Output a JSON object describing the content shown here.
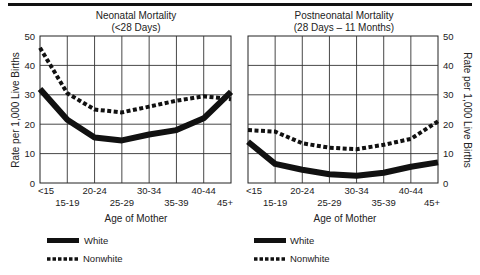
{
  "chart_data": [
    {
      "type": "line",
      "title": "Neonatal Mortality",
      "subtitle": "(<28 Days)",
      "xlabel": "Age of Mother",
      "ylabel": "Rate per 1,000 Live Births",
      "ylim": [
        0,
        50
      ],
      "yticks": [
        0,
        10,
        20,
        30,
        40,
        50
      ],
      "grid": true,
      "categories": [
        "<15",
        "15-19",
        "20-24",
        "25-29",
        "30-34",
        "35-39",
        "40-44",
        "45+"
      ],
      "series": [
        {
          "name": "White",
          "style": "solid-thick",
          "values": [
            32,
            21.5,
            15.5,
            14.5,
            16.5,
            18,
            22,
            31
          ]
        },
        {
          "name": "Nonwhite",
          "style": "dotted-thick",
          "values": [
            46,
            30.5,
            25,
            24,
            26,
            28,
            29.5,
            28.5
          ]
        }
      ],
      "legend": [
        "White",
        "Nonwhite"
      ],
      "legend_position": "bottom-left"
    },
    {
      "type": "line",
      "title": "Postneonatal Mortality",
      "subtitle": "(28 Days – 11 Months)",
      "xlabel": "Age of Mother",
      "ylabel": "Rate per 1,000 Live Births",
      "ylim": [
        0,
        50
      ],
      "yticks": [
        0,
        10,
        20,
        30,
        40,
        50
      ],
      "grid": true,
      "categories": [
        "<15",
        "15-19",
        "20-24",
        "25-29",
        "30-34",
        "35-39",
        "40-44",
        "45+"
      ],
      "series": [
        {
          "name": "White",
          "style": "solid-thick",
          "values": [
            14,
            6.5,
            4.5,
            3,
            2.5,
            3.5,
            5.5,
            7
          ]
        },
        {
          "name": "Nonwhite",
          "style": "dotted-thick",
          "values": [
            18,
            17.5,
            13.5,
            12,
            11.5,
            13,
            15,
            21
          ]
        }
      ],
      "legend": [
        "White",
        "Nonwhite"
      ],
      "legend_position": "bottom-left"
    }
  ],
  "left": {
    "title": "Neonatal Mortality",
    "subtitle": "(<28 Days)",
    "ylabel": "Rate per 1,000 Live Births",
    "xlabel": "Age of Mother",
    "yticks": [
      "0",
      "10",
      "20",
      "30",
      "40",
      "50"
    ],
    "xticks_upper": [
      "<15",
      "20-24",
      "30-34",
      "40-44"
    ],
    "xticks_lower": [
      "15-19",
      "25-29",
      "35-39",
      "45+"
    ],
    "legend": {
      "white": "White",
      "nonwhite": "Nonwhite"
    }
  },
  "right": {
    "title": "Postneonatal Mortality",
    "subtitle": "(28 Days – 11 Months)",
    "ylabel": "Rate per 1,000 Live Births",
    "xlabel": "Age of Mother",
    "yticks": [
      "0",
      "10",
      "20",
      "30",
      "40",
      "50"
    ],
    "xticks_upper": [
      "<15",
      "20-24",
      "30-34",
      "40-44"
    ],
    "xticks_lower": [
      "15-19",
      "25-29",
      "35-39",
      "45+"
    ],
    "legend": {
      "white": "White",
      "nonwhite": "Nonwhite"
    }
  }
}
